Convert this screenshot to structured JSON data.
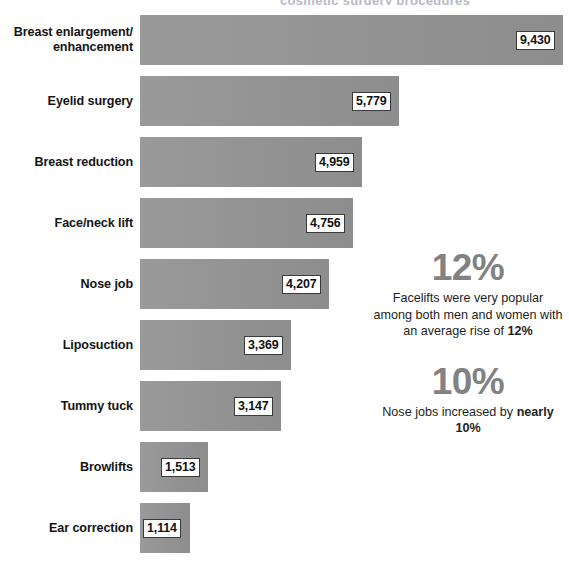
{
  "title_sliver": "cosmetic surgery procedures",
  "chart_data": {
    "type": "bar",
    "orientation": "horizontal",
    "title": "",
    "xlabel": "",
    "ylabel": "",
    "grid": false,
    "legend": "none",
    "xlim": [
      0,
      9430
    ],
    "categories": [
      "Breast enlargement/ enhancement",
      "Eyelid surgery",
      "Breast reduction",
      "Face/neck lift",
      "Nose job",
      "Liposuction",
      "Tummy tuck",
      "Browlifts",
      "Ear correction"
    ],
    "values": [
      9430,
      5779,
      4959,
      4756,
      4207,
      3369,
      3147,
      1513,
      1114
    ],
    "value_labels": [
      "9,430",
      "5,779",
      "4,959",
      "4,756",
      "4,207",
      "3,369",
      "3,147",
      "1,513",
      "1,114"
    ],
    "bar_color": "#949494",
    "label_box_fill": "#ffffff",
    "label_box_border": "#3a3a3a"
  },
  "bars": [
    {
      "label_line1": "Breast enlargement/",
      "label_line2": "enhancement",
      "value_label": "9,430"
    },
    {
      "label_line1": "Eyelid surgery",
      "label_line2": "",
      "value_label": "5,779"
    },
    {
      "label_line1": "Breast reduction",
      "label_line2": "",
      "value_label": "4,959"
    },
    {
      "label_line1": "Face/neck lift",
      "label_line2": "",
      "value_label": "4,756"
    },
    {
      "label_line1": "Nose job",
      "label_line2": "",
      "value_label": "4,207"
    },
    {
      "label_line1": "Liposuction",
      "label_line2": "",
      "value_label": "3,369"
    },
    {
      "label_line1": "Tummy tuck",
      "label_line2": "",
      "value_label": "3,147"
    },
    {
      "label_line1": "Browlifts",
      "label_line2": "",
      "value_label": "1,513"
    },
    {
      "label_line1": "Ear correction",
      "label_line2": "",
      "value_label": "1,114"
    }
  ],
  "callouts": [
    {
      "big": "12%",
      "text_parts": [
        "Facelifts were very popular among both men and women with an average rise of ",
        "12%"
      ],
      "color": "#828282"
    },
    {
      "big": "10%",
      "text_parts": [
        "Nose jobs increased by ",
        "nearly 10%"
      ],
      "color": "#828282"
    }
  ]
}
